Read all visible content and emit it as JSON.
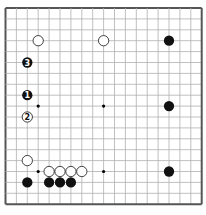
{
  "board": {
    "size": 19,
    "origin": {
      "x": 5.5,
      "y": 8
    },
    "spacing": {
      "x": 10.9,
      "y": 10.9
    },
    "border_color": "#555555",
    "line_color": "#b0b0b0",
    "background": "#ffffff",
    "hoshi": [
      [
        3,
        3
      ],
      [
        9,
        3
      ],
      [
        15,
        3
      ],
      [
        3,
        9
      ],
      [
        9,
        9
      ],
      [
        15,
        9
      ],
      [
        3,
        15
      ],
      [
        9,
        15
      ],
      [
        15,
        15
      ]
    ]
  },
  "stones": [
    {
      "color": "white",
      "col": 3,
      "row": 3,
      "label": ""
    },
    {
      "color": "white",
      "col": 9,
      "row": 3,
      "label": ""
    },
    {
      "color": "black",
      "col": 15,
      "row": 3,
      "label": ""
    },
    {
      "color": "black",
      "col": 2,
      "row": 5,
      "label": "3"
    },
    {
      "color": "black",
      "col": 2,
      "row": 8,
      "label": "1"
    },
    {
      "color": "black",
      "col": 15,
      "row": 9,
      "label": ""
    },
    {
      "color": "white",
      "col": 2,
      "row": 10,
      "label": "2"
    },
    {
      "color": "white",
      "col": 2,
      "row": 14,
      "label": ""
    },
    {
      "color": "white",
      "col": 4,
      "row": 15,
      "label": ""
    },
    {
      "color": "white",
      "col": 5,
      "row": 15,
      "label": ""
    },
    {
      "color": "white",
      "col": 6,
      "row": 15,
      "label": ""
    },
    {
      "color": "white",
      "col": 7,
      "row": 15,
      "label": ""
    },
    {
      "color": "black",
      "col": 15,
      "row": 15,
      "label": ""
    },
    {
      "color": "black",
      "col": 2,
      "row": 16,
      "label": ""
    },
    {
      "color": "black",
      "col": 4,
      "row": 16,
      "label": ""
    },
    {
      "color": "black",
      "col": 5,
      "row": 16,
      "label": ""
    },
    {
      "color": "black",
      "col": 6,
      "row": 16,
      "label": ""
    }
  ]
}
